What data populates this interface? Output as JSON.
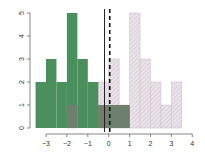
{
  "chart_data": {
    "type": "bar",
    "title": "",
    "xlabel": "",
    "ylabel": "",
    "xlim": [
      -3.5,
      4
    ],
    "ylim": [
      0,
      5
    ],
    "grid": false,
    "legend": null,
    "xticks": [
      -3,
      -2,
      -1,
      0,
      1,
      2,
      3,
      4
    ],
    "yticks": [
      0,
      1,
      2,
      3,
      4,
      5
    ],
    "bin_width": 0.5,
    "series": [
      {
        "name": "group1",
        "style": "solid",
        "color": "#4a8f5c",
        "bins": [
          {
            "x0": -3.5,
            "x1": -3.0,
            "count": 2
          },
          {
            "x0": -3.0,
            "x1": -2.5,
            "count": 3
          },
          {
            "x0": -2.5,
            "x1": -2.0,
            "count": 2
          },
          {
            "x0": -2.0,
            "x1": -1.5,
            "count": 5
          },
          {
            "x0": -1.5,
            "x1": -1.0,
            "count": 3
          },
          {
            "x0": -1.0,
            "x1": -0.5,
            "count": 2
          },
          {
            "x0": -0.5,
            "x1": 0.0,
            "count": 1
          },
          {
            "x0": 0.0,
            "x1": 0.5,
            "count": 1
          },
          {
            "x0": 0.5,
            "x1": 1.0,
            "count": 1
          }
        ]
      },
      {
        "name": "group2",
        "style": "hatched",
        "color": "#e6dde6",
        "bins": [
          {
            "x0": -2.0,
            "x1": -1.5,
            "count": 1
          },
          {
            "x0": -1.5,
            "x1": -1.0,
            "count": 0
          },
          {
            "x0": -1.0,
            "x1": -0.5,
            "count": 0
          },
          {
            "x0": -0.5,
            "x1": 0.0,
            "count": 2
          },
          {
            "x0": 0.0,
            "x1": 0.5,
            "count": 3
          },
          {
            "x0": 0.5,
            "x1": 1.0,
            "count": 1
          },
          {
            "x0": 1.0,
            "x1": 1.5,
            "count": 5
          },
          {
            "x0": 1.5,
            "x1": 2.0,
            "count": 3
          },
          {
            "x0": 2.0,
            "x1": 2.5,
            "count": 2
          },
          {
            "x0": 2.5,
            "x1": 3.0,
            "count": 1
          },
          {
            "x0": 3.0,
            "x1": 3.5,
            "count": 2
          }
        ]
      }
    ],
    "vlines": [
      {
        "x": -0.2,
        "style": "solid",
        "color": "#222222"
      },
      {
        "x": 0.05,
        "style": "dashed",
        "color": "#111111"
      }
    ],
    "overlap_color": "#6e7f6e"
  }
}
